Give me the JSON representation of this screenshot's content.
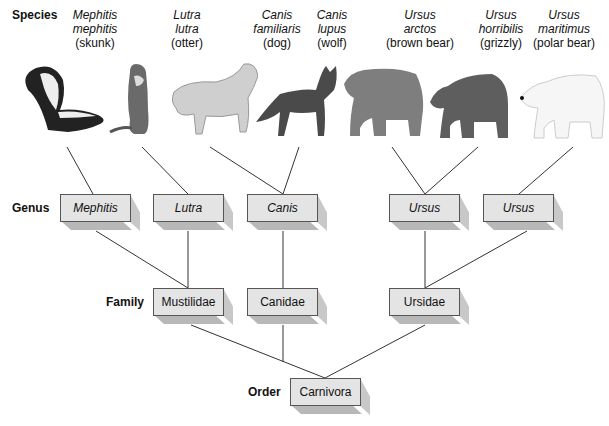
{
  "ranks": {
    "species": "Species",
    "genus": "Genus",
    "family": "Family",
    "order": "Order"
  },
  "species": [
    {
      "genus": "Mephitis",
      "epithet": "mephitis",
      "common": "(skunk)"
    },
    {
      "genus": "Lutra",
      "epithet": "lutra",
      "common": "(otter)"
    },
    {
      "genus": "Canis",
      "epithet": "familiaris",
      "common": "(dog)"
    },
    {
      "genus": "Canis",
      "epithet": "lupus",
      "common": "(wolf)"
    },
    {
      "genus": "Ursus",
      "epithet": "arctos",
      "common": "(brown bear)"
    },
    {
      "genus": "Ursus",
      "epithet": "horribilis",
      "common": "(grizzly)"
    },
    {
      "genus": "Ursus",
      "epithet": "maritimus",
      "common": "(polar bear)"
    }
  ],
  "genera": [
    "Mephitis",
    "Lutra",
    "Canis",
    "Ursus",
    "Ursus"
  ],
  "families": [
    "Mustilidae",
    "Canidae",
    "Ursidae"
  ],
  "order": "Carnivora",
  "colors": {
    "box_face": "#e4e4e4",
    "box_shadow": "#b8b8b8",
    "line": "#333333"
  }
}
